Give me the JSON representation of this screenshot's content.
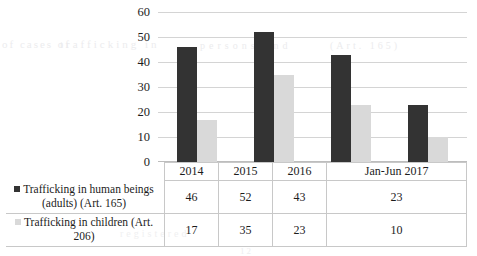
{
  "chart_data": {
    "type": "bar",
    "title": "",
    "xlabel": "",
    "ylabel": "",
    "ylim": [
      0,
      60
    ],
    "yticks": [
      0,
      10,
      20,
      30,
      40,
      50,
      60
    ],
    "grid": true,
    "legend_position": "table-left",
    "categories": [
      "2014",
      "2015",
      "2016",
      "Jan-Jun 2017"
    ],
    "series": [
      {
        "name": "Trafficking in human beings (adults) (Art. 165)",
        "name_line1": "Trafficking in human beings",
        "name_line2": "(adults) (Art. 165)",
        "color": "#333333",
        "values": [
          46,
          52,
          43,
          23
        ]
      },
      {
        "name": "Trafficking in children (Art. 206)",
        "name_line1": "Trafficking in children (Art.",
        "name_line2": "206)",
        "color": "#d9d9d9",
        "values": [
          17,
          35,
          23,
          10
        ]
      }
    ]
  },
  "table": {
    "header": [
      "2014",
      "2015",
      "2016",
      "Jan-Jun 2017"
    ],
    "rows": [
      {
        "label_line1": "Trafficking in human beings",
        "label_line2": "(adults) (Art. 165)",
        "values": [
          "46",
          "52",
          "43",
          "23"
        ]
      },
      {
        "label_line1": "Trafficking in children (Art.",
        "label_line2": "206)",
        "values": [
          "17",
          "35",
          "23",
          "10"
        ]
      }
    ]
  },
  "axis": {
    "y_labels": [
      "60",
      "50",
      "40",
      "30",
      "20",
      "10",
      "0"
    ]
  },
  "artifacts": {
    "a": "of cases of",
    "b": "trafficking in",
    "c": "persons and",
    "d": "(Art. 165)",
    "e": "registered",
    "f": "12"
  }
}
